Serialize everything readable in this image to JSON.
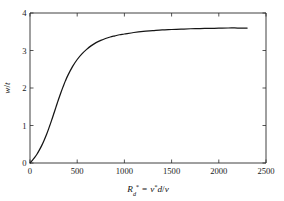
{
  "chart_data": {
    "type": "line",
    "title": "",
    "subtitle": "",
    "xlabel": "R_d* = v*d/v",
    "ylabel": "w/t",
    "xlabel_parts": {
      "var": "R",
      "var_sub": "d",
      "star1": "*",
      "equals": "=",
      "num": "v",
      "star2": "*",
      "d": "d",
      "slash": "/",
      "nu": "v"
    },
    "ylabel_parts": {
      "num": "w",
      "slash": "/",
      "den": "t"
    },
    "xlim": [
      0,
      2500
    ],
    "ylim": [
      0,
      4
    ],
    "xticks": [
      0,
      500,
      1000,
      1500,
      2000,
      2500
    ],
    "yticks": [
      0,
      1,
      2,
      3,
      4
    ],
    "xtick_labels": [
      "0",
      "500",
      "1000",
      "1500",
      "2000",
      "2500"
    ],
    "ytick_labels": [
      "0",
      "1",
      "2",
      "3",
      "4"
    ],
    "grid": false,
    "legend": false,
    "legend_position": "none",
    "frame": "box",
    "tick_direction": "in",
    "line_color": "#151515",
    "axis_color": "#2b2b2b",
    "background_color": "#ffffff",
    "series": [
      {
        "name": "w/t vs Rd*",
        "x": [
          0,
          25,
          50,
          75,
          100,
          125,
          150,
          175,
          200,
          225,
          250,
          275,
          300,
          325,
          350,
          375,
          400,
          450,
          500,
          550,
          600,
          650,
          700,
          750,
          800,
          850,
          900,
          950,
          1000,
          1100,
          1200,
          1300,
          1400,
          1500,
          1600,
          1700,
          1800,
          1900,
          2000,
          2100,
          2200,
          2300
        ],
        "y": [
          0.0,
          0.07,
          0.15,
          0.24,
          0.35,
          0.47,
          0.61,
          0.76,
          0.93,
          1.11,
          1.3,
          1.49,
          1.68,
          1.86,
          2.03,
          2.19,
          2.33,
          2.57,
          2.76,
          2.91,
          3.03,
          3.13,
          3.21,
          3.27,
          3.32,
          3.36,
          3.39,
          3.42,
          3.44,
          3.48,
          3.51,
          3.53,
          3.55,
          3.56,
          3.57,
          3.58,
          3.585,
          3.59,
          3.595,
          3.6,
          3.6,
          3.6
        ]
      }
    ]
  }
}
